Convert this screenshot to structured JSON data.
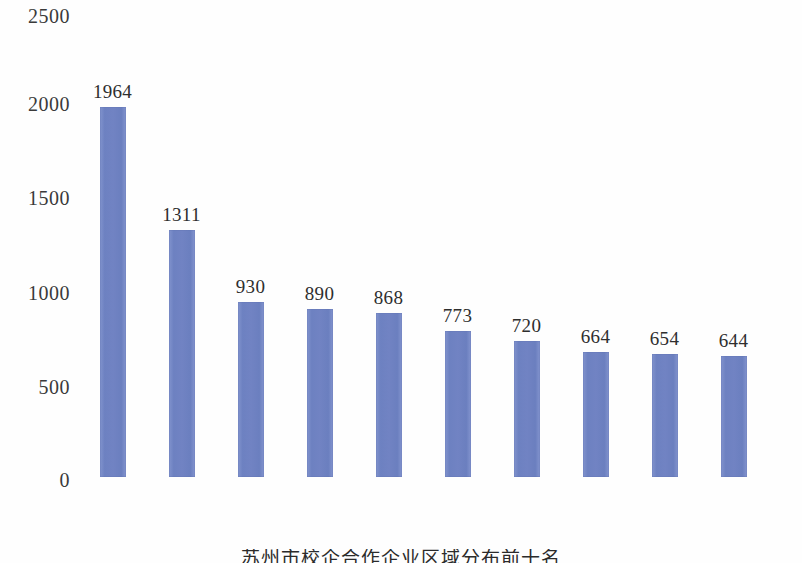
{
  "chart_data": {
    "type": "bar",
    "title": "",
    "subtitle": "",
    "xlabel": "",
    "ylabel": "",
    "categories": [
      "苏州",
      "南京",
      "南通",
      "上海",
      "常州",
      "无锡",
      "盐城",
      "成都",
      "徐州",
      "北京"
    ],
    "values": [
      1964,
      1311,
      930,
      890,
      868,
      773,
      720,
      664,
      654,
      644
    ],
    "data_labels": [
      "1964",
      "1311",
      "930",
      "890",
      "868",
      "773",
      "720",
      "664",
      "654",
      "644"
    ],
    "ylim": [
      0,
      2500
    ],
    "y_ticks": [
      0,
      500,
      1000,
      1500,
      2000,
      2500
    ],
    "y_tick_labels": [
      "0",
      "500",
      "1000",
      "1500",
      "2000",
      "2500"
    ],
    "grid": false,
    "axis_lines": false,
    "legend": null,
    "legend_position": "none",
    "bar_color": "#7184c4",
    "background_color": "#fefefe",
    "x_tick_rotation": -42,
    "annotations": []
  },
  "caption": {
    "text": "苏州市校企合作企业区域分布前十名",
    "visible_fragment": "苏州市校企合作企业区域分布前十名"
  }
}
